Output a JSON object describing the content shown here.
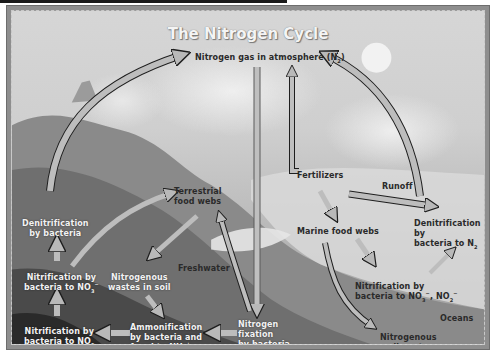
{
  "title": "The Nitrogen Cycle",
  "nodes": {
    "atmosphere": {
      "text": "Nitrogen gas in atmosphere (N",
      "sub": "2",
      "tail": ")"
    },
    "denitrification_land": {
      "line1": "Denitrification",
      "line2": "by bacteria"
    },
    "nitrification_no3": {
      "line1": "Nitrification by",
      "line2": "bacteria to NO",
      "sub": "3",
      "sup": "−"
    },
    "nitrification_no2": {
      "line1": "Nitrification by",
      "line2": "bacteria to NO",
      "sub": "2"
    },
    "terrestrial_food_webs": {
      "line1": "Terrestrial",
      "line2": "food webs"
    },
    "nitrogenous_wastes": {
      "line1": "Nitrogenous",
      "line2": "wastes in soil"
    },
    "ammonification": {
      "line1": "Ammonification",
      "line2": "by bacteria and",
      "line3": "fungi to NH",
      "sub": "4",
      "sup": "+"
    },
    "freshwater": "Freshwater",
    "nitrogen_fixation": {
      "line1": "Nitrogen",
      "line2": "fixation",
      "line3": "by bacteria"
    },
    "fertilizers": "Fertilizers",
    "runoff": "Runoff",
    "marine_food_webs": "Marine food webs",
    "denitrification_ocean": {
      "line1": "Denitrification by",
      "line2": "bacteria to N",
      "sub": "2"
    },
    "nitrification_ocean": {
      "line1": "Nitrification by",
      "line2": "bacteria to NO",
      "sub": "3",
      "sup": "−",
      "mid": ", NO",
      "sub2": "2",
      "sup2": "−"
    },
    "oceans": "Oceans",
    "sediments": {
      "line1": "Nitrogenous sediments",
      "line2": "fall to ocean floor"
    }
  },
  "colors": {
    "arrow_fill": "#b9b9b9",
    "arrow_edge": "#1e1e1e",
    "frame": "#8e8e8e",
    "text_dark": "#2a2a2a",
    "text_light": "#f2f2f2"
  }
}
